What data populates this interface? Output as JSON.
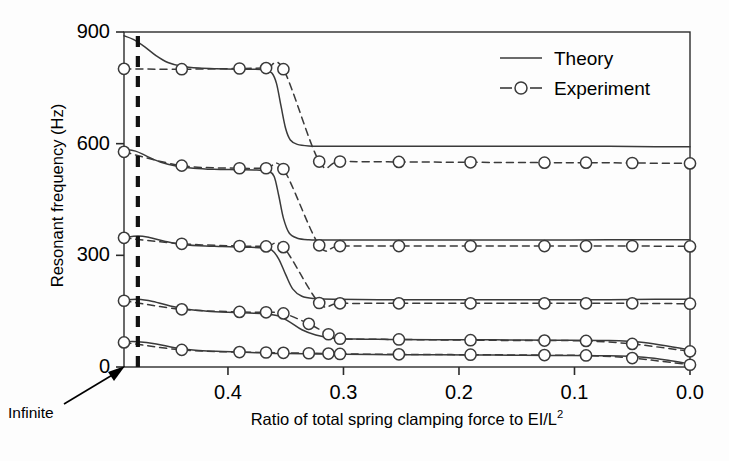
{
  "figure": {
    "ylabel": "Resonant frequency (Hz)",
    "xlabel_prefix": "Ratio of total spring clamping force to EI/L",
    "xlabel_exponent": "2",
    "annotation": "Infinite"
  },
  "legend": {
    "position": "top-right",
    "entries": [
      {
        "label": "Theory",
        "style": "solid-line",
        "marker": "none"
      },
      {
        "label": "Experiment",
        "style": "dashed-line",
        "marker": "open-circle"
      }
    ]
  },
  "chart_data": {
    "type": "line",
    "title": "",
    "xlabel": "Ratio of total spring clamping force to EI/L^2",
    "ylabel": "Resonant frequency (Hz)",
    "xlim": [
      0.49,
      0.0
    ],
    "ylim": [
      0,
      900
    ],
    "x_reversed": true,
    "grid": false,
    "xticks": [
      0.4,
      0.3,
      0.2,
      0.1,
      0.0
    ],
    "xtick_labels": [
      "0.4",
      "0.3",
      "0.2",
      "0.1",
      "0.0"
    ],
    "yticks": [
      0,
      300,
      600,
      900
    ],
    "ytick_labels": [
      "0",
      "300",
      "600",
      "900"
    ],
    "vertical_reference_line": {
      "x": 0.478,
      "style": "thick-dashed",
      "label": "Infinite"
    },
    "series": [
      {
        "name": "Mode 5 - Theory",
        "style": "solid",
        "marker": "none",
        "points": [
          [
            0.49,
            890
          ],
          [
            0.482,
            880
          ],
          [
            0.472,
            860
          ],
          [
            0.462,
            836
          ],
          [
            0.452,
            818
          ],
          [
            0.44,
            808
          ],
          [
            0.425,
            803
          ],
          [
            0.41,
            801
          ],
          [
            0.392,
            800
          ],
          [
            0.378,
            800
          ],
          [
            0.368,
            798
          ],
          [
            0.362,
            790
          ],
          [
            0.358,
            762
          ],
          [
            0.354,
            700
          ],
          [
            0.35,
            640
          ],
          [
            0.346,
            610
          ],
          [
            0.34,
            598
          ],
          [
            0.33,
            594
          ],
          [
            0.31,
            593
          ],
          [
            0.27,
            593
          ],
          [
            0.22,
            593
          ],
          [
            0.17,
            593
          ],
          [
            0.12,
            593
          ],
          [
            0.07,
            593
          ],
          [
            0.03,
            592
          ],
          [
            0.0,
            592
          ]
        ]
      },
      {
        "name": "Mode 5 - Experiment",
        "style": "dashed",
        "marker": "open-circle",
        "points": [
          [
            0.49,
            801
          ],
          [
            0.44,
            800
          ],
          [
            0.39,
            802
          ],
          [
            0.367,
            803
          ],
          [
            0.352,
            800
          ],
          [
            0.321,
            552
          ],
          [
            0.303,
            552
          ],
          [
            0.252,
            551
          ],
          [
            0.19,
            550
          ],
          [
            0.126,
            549
          ],
          [
            0.09,
            549
          ],
          [
            0.05,
            548
          ],
          [
            0.0,
            547
          ]
        ]
      },
      {
        "name": "Mode 4 - Theory",
        "style": "solid",
        "marker": "none",
        "points": [
          [
            0.49,
            585
          ],
          [
            0.48,
            580
          ],
          [
            0.47,
            566
          ],
          [
            0.458,
            550
          ],
          [
            0.445,
            540
          ],
          [
            0.43,
            534
          ],
          [
            0.412,
            531
          ],
          [
            0.392,
            530
          ],
          [
            0.375,
            529
          ],
          [
            0.365,
            526
          ],
          [
            0.36,
            512
          ],
          [
            0.356,
            460
          ],
          [
            0.352,
            400
          ],
          [
            0.347,
            360
          ],
          [
            0.34,
            346
          ],
          [
            0.33,
            342
          ],
          [
            0.31,
            341
          ],
          [
            0.27,
            341
          ],
          [
            0.22,
            341
          ],
          [
            0.17,
            341
          ],
          [
            0.12,
            341
          ],
          [
            0.07,
            342
          ],
          [
            0.03,
            342
          ],
          [
            0.0,
            342
          ]
        ]
      },
      {
        "name": "Mode 4 - Experiment",
        "style": "dashed",
        "marker": "open-circle",
        "points": [
          [
            0.49,
            578
          ],
          [
            0.44,
            541
          ],
          [
            0.39,
            534
          ],
          [
            0.367,
            534
          ],
          [
            0.352,
            532
          ],
          [
            0.321,
            327
          ],
          [
            0.303,
            325
          ],
          [
            0.252,
            325
          ],
          [
            0.19,
            325
          ],
          [
            0.126,
            325
          ],
          [
            0.09,
            325
          ],
          [
            0.05,
            325
          ],
          [
            0.0,
            324
          ]
        ]
      },
      {
        "name": "Mode 3 - Theory",
        "style": "solid",
        "marker": "none",
        "points": [
          [
            0.49,
            348
          ],
          [
            0.478,
            352
          ],
          [
            0.468,
            348
          ],
          [
            0.455,
            338
          ],
          [
            0.442,
            330
          ],
          [
            0.425,
            326
          ],
          [
            0.405,
            324
          ],
          [
            0.385,
            322
          ],
          [
            0.37,
            320
          ],
          [
            0.362,
            314
          ],
          [
            0.356,
            290
          ],
          [
            0.35,
            248
          ],
          [
            0.344,
            210
          ],
          [
            0.336,
            190
          ],
          [
            0.325,
            184
          ],
          [
            0.305,
            182
          ],
          [
            0.27,
            181
          ],
          [
            0.22,
            181
          ],
          [
            0.17,
            181
          ],
          [
            0.12,
            181
          ],
          [
            0.07,
            181
          ],
          [
            0.03,
            182
          ],
          [
            0.0,
            182
          ]
        ]
      },
      {
        "name": "Mode 3 - Experiment",
        "style": "dashed",
        "marker": "open-circle",
        "points": [
          [
            0.49,
            347
          ],
          [
            0.44,
            331
          ],
          [
            0.39,
            325
          ],
          [
            0.367,
            324
          ],
          [
            0.352,
            322
          ],
          [
            0.321,
            172
          ],
          [
            0.303,
            171
          ],
          [
            0.252,
            171
          ],
          [
            0.19,
            171
          ],
          [
            0.126,
            171
          ],
          [
            0.09,
            171
          ],
          [
            0.05,
            171
          ],
          [
            0.0,
            170
          ]
        ]
      },
      {
        "name": "Mode 2 - Theory",
        "style": "solid",
        "marker": "none",
        "points": [
          [
            0.49,
            180
          ],
          [
            0.478,
            182
          ],
          [
            0.465,
            176
          ],
          [
            0.45,
            164
          ],
          [
            0.435,
            155
          ],
          [
            0.418,
            150
          ],
          [
            0.4,
            147
          ],
          [
            0.382,
            145
          ],
          [
            0.368,
            143
          ],
          [
            0.356,
            137
          ],
          [
            0.346,
            120
          ],
          [
            0.336,
            100
          ],
          [
            0.324,
            86
          ],
          [
            0.31,
            78
          ],
          [
            0.29,
            75
          ],
          [
            0.26,
            74
          ],
          [
            0.22,
            73
          ],
          [
            0.17,
            73
          ],
          [
            0.12,
            72
          ],
          [
            0.07,
            71
          ],
          [
            0.04,
            66
          ],
          [
            0.015,
            54
          ],
          [
            0.0,
            46
          ]
        ]
      },
      {
        "name": "Mode 2 - Experiment",
        "style": "dashed",
        "marker": "open-circle",
        "points": [
          [
            0.49,
            178
          ],
          [
            0.44,
            155
          ],
          [
            0.39,
            148
          ],
          [
            0.367,
            147
          ],
          [
            0.352,
            144
          ],
          [
            0.33,
            116
          ],
          [
            0.313,
            88
          ],
          [
            0.303,
            76
          ],
          [
            0.252,
            74
          ],
          [
            0.19,
            72
          ],
          [
            0.126,
            71
          ],
          [
            0.09,
            70
          ],
          [
            0.05,
            62
          ],
          [
            0.0,
            42
          ]
        ]
      },
      {
        "name": "Mode 1 - Theory",
        "style": "solid",
        "marker": "none",
        "points": [
          [
            0.49,
            68
          ],
          [
            0.478,
            68
          ],
          [
            0.462,
            62
          ],
          [
            0.446,
            52
          ],
          [
            0.428,
            45
          ],
          [
            0.41,
            42
          ],
          [
            0.39,
            40
          ],
          [
            0.37,
            38
          ],
          [
            0.35,
            36
          ],
          [
            0.325,
            35
          ],
          [
            0.3,
            34
          ],
          [
            0.26,
            33
          ],
          [
            0.22,
            33
          ],
          [
            0.17,
            32
          ],
          [
            0.12,
            31
          ],
          [
            0.07,
            30
          ],
          [
            0.04,
            26
          ],
          [
            0.015,
            16
          ],
          [
            0.0,
            8
          ]
        ]
      },
      {
        "name": "Mode 1 - Experiment",
        "style": "dashed",
        "marker": "open-circle",
        "points": [
          [
            0.49,
            66
          ],
          [
            0.44,
            46
          ],
          [
            0.39,
            40
          ],
          [
            0.367,
            39
          ],
          [
            0.352,
            38
          ],
          [
            0.33,
            37
          ],
          [
            0.313,
            36
          ],
          [
            0.303,
            35
          ],
          [
            0.252,
            34
          ],
          [
            0.19,
            33
          ],
          [
            0.126,
            32
          ],
          [
            0.09,
            31
          ],
          [
            0.05,
            24
          ],
          [
            0.0,
            6
          ]
        ]
      }
    ]
  },
  "colors": {
    "line": "#3a3a3a",
    "axis": "#2b2b2b",
    "marker_fill": "#ffffff",
    "text": "#000000"
  }
}
